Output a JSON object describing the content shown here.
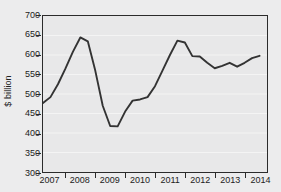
{
  "chart_data": {
    "type": "line",
    "title": "",
    "subtitle": "",
    "xlabel": "",
    "ylabel": "$ billion",
    "ylim": [
      300,
      700
    ],
    "xlim": [
      2006.75,
      2014.25
    ],
    "y_ticks": [
      300,
      350,
      400,
      450,
      500,
      550,
      600,
      650,
      700
    ],
    "x_ticks": [
      "2007",
      "2008",
      "2009",
      "2010",
      "2011",
      "2012",
      "2013",
      "2014"
    ],
    "grid": "horizontal",
    "legend": "none",
    "line_color": "#333333",
    "plot_background": "#e8e8e9",
    "figure_background": "#ececed",
    "frame_color": "#2b2b2b",
    "series": [
      {
        "name": "$ billion",
        "x": [
          2006.75,
          2007.0,
          2007.25,
          2007.5,
          2007.75,
          2008.0,
          2008.25,
          2008.5,
          2008.75,
          2009.0,
          2009.25,
          2009.5,
          2009.75,
          2010.0,
          2010.25,
          2010.5,
          2010.75,
          2011.0,
          2011.25,
          2011.5,
          2011.75,
          2012.0,
          2012.25,
          2012.5,
          2012.75,
          2013.0,
          2013.25,
          2013.5,
          2013.75,
          2014.0
        ],
        "values": [
          477,
          492,
          525,
          565,
          608,
          645,
          635,
          560,
          470,
          418,
          417,
          455,
          483,
          486,
          492,
          520,
          560,
          600,
          637,
          632,
          597,
          596,
          580,
          566,
          572,
          580,
          570,
          580,
          592,
          598
        ]
      }
    ]
  }
}
